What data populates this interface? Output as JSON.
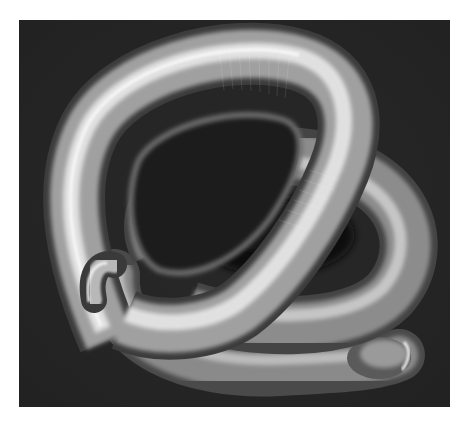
{
  "image": {
    "subject": "Scanning electron micrograph of a coiled nematode worm",
    "style": "grayscale SEM",
    "colors": {
      "page_background": "#ffffff",
      "panel_background": "#262626",
      "worm_highlight": "#f2f2f2",
      "worm_mid": "#9a9a9a",
      "worm_shadow": "#3a3a3a"
    }
  }
}
